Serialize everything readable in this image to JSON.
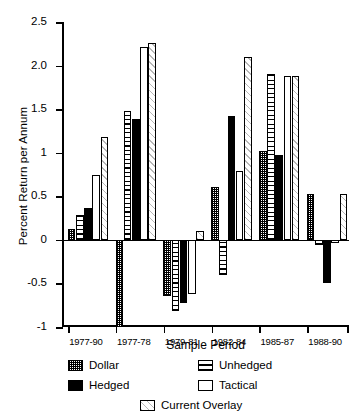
{
  "chart_data": {
    "type": "bar",
    "title": "",
    "subtitle": "",
    "xlabel": "Sample Period",
    "ylabel": "Percent Return per Annum",
    "categories": [
      "1977-90",
      "1977-78",
      "1979-81",
      "1982-84",
      "1985-87",
      "1988-90"
    ],
    "ylim": [
      -1,
      2.5
    ],
    "ytick_labels": [
      "2.5",
      "2.0",
      "1.5",
      "1",
      "0.5",
      "0",
      "-0.5",
      "-1"
    ],
    "ytick_values": [
      2.5,
      2.0,
      1.5,
      1.0,
      0.5,
      0.0,
      -0.5,
      -1.0
    ],
    "grid": false,
    "legend_position": "bottom",
    "series": [
      {
        "name": "Dollar",
        "pattern": "checkered",
        "color": "#000000",
        "values": [
          0.12,
          -1.0,
          -0.65,
          0.61,
          1.02,
          0.53
        ]
      },
      {
        "name": "Unhedged",
        "pattern": "horizontal-stripes",
        "color": "#000000",
        "values": [
          0.28,
          1.48,
          -0.82,
          -0.4,
          1.9,
          -0.06
        ]
      },
      {
        "name": "Hedged",
        "pattern": "solid-black",
        "color": "#000000",
        "values": [
          0.37,
          1.39,
          -0.72,
          1.42,
          0.97,
          -0.5
        ]
      },
      {
        "name": "Tactical",
        "pattern": "empty-white",
        "color": "#ffffff",
        "values": [
          0.74,
          2.21,
          -0.62,
          0.79,
          1.88,
          -0.04
        ]
      },
      {
        "name": "Current Overlay",
        "pattern": "diagonal-hatch",
        "color": "#b8b8b8",
        "values": [
          1.18,
          2.26,
          0.1,
          2.1,
          1.88,
          0.53
        ]
      }
    ]
  },
  "legend": {
    "items": [
      {
        "label": "Dollar"
      },
      {
        "label": "Hedged"
      },
      {
        "label": "Unhedged"
      },
      {
        "label": "Tactical"
      },
      {
        "label": "Current Overlay"
      }
    ]
  }
}
